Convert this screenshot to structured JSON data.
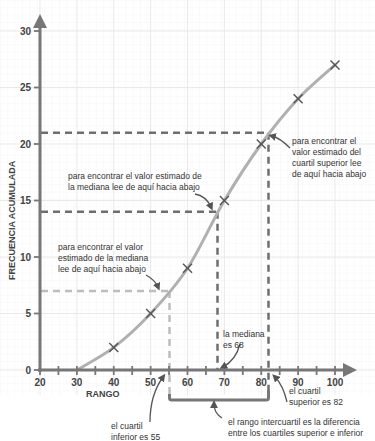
{
  "chart_data": {
    "type": "line",
    "title": "",
    "xlabel": "RANGO",
    "ylabel": "FRECUENCIA ACUMULADA",
    "xlim": [
      20,
      100
    ],
    "ylim": [
      0,
      30
    ],
    "x_ticks": [
      "20",
      "30",
      "40",
      "50",
      "60",
      "70",
      "80",
      "90",
      "100"
    ],
    "y_ticks": [
      "0",
      "5",
      "10",
      "15",
      "20",
      "25",
      "30"
    ],
    "grid": true,
    "series": [
      {
        "name": "frecuencia acumulada",
        "x": [
          30,
          40,
          50,
          60,
          70,
          80,
          90,
          100
        ],
        "y": [
          0,
          2,
          5,
          9,
          15,
          20,
          24,
          27
        ],
        "markers": [
          {
            "x": 40,
            "y": 2
          },
          {
            "x": 50,
            "y": 5
          },
          {
            "x": 60,
            "y": 9
          },
          {
            "x": 70,
            "y": 15
          },
          {
            "x": 80,
            "y": 20
          },
          {
            "x": 90,
            "y": 24
          },
          {
            "x": 100,
            "y": 27
          }
        ]
      }
    ],
    "reference_lines": [
      {
        "name": "cuartil inferior",
        "y": 7,
        "x": 55,
        "color": "#b5b5b5"
      },
      {
        "name": "mediana",
        "y": 14,
        "x": 68,
        "color": "#6e6e6e"
      },
      {
        "name": "cuartil superior",
        "y": 21,
        "x": 82,
        "color": "#6e6e6e"
      }
    ],
    "annotations": [
      {
        "id": "q3_read",
        "lines": [
          "para encontrar el",
          "valor estimado del",
          "cuartil superior lee",
          "de aquí hacia abajo"
        ]
      },
      {
        "id": "median_read",
        "lines": [
          "para encontrar el valor estimado de",
          "la mediana lee de aquí hacia abajo"
        ]
      },
      {
        "id": "q1_read",
        "lines": [
          "para encontrar el valor",
          "estimado de la mediana",
          "lee de aquí hacia abajo"
        ]
      },
      {
        "id": "median_value",
        "lines": [
          "la mediana",
          "es 68"
        ]
      },
      {
        "id": "q1_value",
        "lines": [
          "el cuartil",
          "inferior es 55"
        ]
      },
      {
        "id": "q3_value",
        "lines": [
          "el cuartil",
          "superior es 82"
        ]
      },
      {
        "id": "iqr",
        "lines": [
          "el rango intercuartil es la diferencia",
          "entre los cuartiles superior e inferior"
        ]
      }
    ]
  },
  "colors": {
    "curve": "#b0b0b0",
    "axis": "#777777",
    "grid_minor": "#efefef",
    "grid_major": "#e0e0e0",
    "marker": "#555555",
    "dash_dark": "#6e6e6e",
    "dash_light": "#bdbdbd"
  }
}
